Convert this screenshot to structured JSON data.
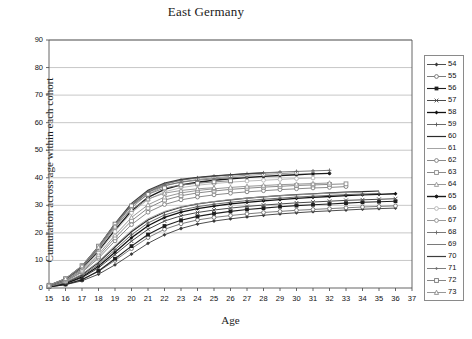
{
  "chart_data": {
    "type": "line",
    "title": "East Germany",
    "xlabel": "Age",
    "ylabel": "Cumulation across age within each cohort",
    "xlim": [
      15,
      37
    ],
    "ylim": [
      0,
      90
    ],
    "yticks": [
      0,
      10,
      20,
      30,
      40,
      50,
      60,
      70,
      80,
      90
    ],
    "xticks": [
      15,
      16,
      17,
      18,
      19,
      20,
      21,
      22,
      23,
      24,
      25,
      26,
      27,
      28,
      29,
      30,
      31,
      32,
      33,
      34,
      35,
      36,
      37
    ],
    "grid": "horizontal",
    "legend_position": "right",
    "legend_title": "",
    "series": [
      {
        "name": "54",
        "marker": "diamond-filled",
        "color": "#3a3a3a",
        "width": 0.9,
        "x": [
          15,
          16,
          17,
          18,
          19,
          20,
          21,
          22,
          23,
          24,
          25,
          26,
          27,
          28,
          29,
          30,
          31,
          32,
          33,
          34,
          35,
          36
        ],
        "values": [
          0.4,
          1.2,
          2.6,
          5.0,
          8.4,
          12.3,
          16.2,
          19.3,
          21.6,
          23.2,
          24.3,
          25.1,
          25.8,
          26.4,
          26.9,
          27.3,
          27.7,
          28.0,
          28.3,
          28.6,
          28.8,
          29.0
        ]
      },
      {
        "name": "55",
        "marker": "circle-open",
        "color": "#6e6e6e",
        "width": 0.9,
        "x": [
          15,
          16,
          17,
          18,
          19,
          20,
          21,
          22,
          23,
          24,
          25,
          26,
          27,
          28,
          29,
          30,
          31,
          32,
          33,
          34,
          35,
          36
        ],
        "values": [
          0.5,
          1.4,
          3.1,
          6.0,
          10.0,
          14.3,
          18.3,
          21.3,
          23.3,
          24.7,
          25.6,
          26.3,
          26.9,
          27.4,
          27.8,
          28.2,
          28.5,
          28.8,
          29.1,
          29.4,
          29.6,
          29.8
        ]
      },
      {
        "name": "56",
        "marker": "square-filled",
        "color": "#1f1f1f",
        "width": 1.1,
        "x": [
          15,
          16,
          17,
          18,
          19,
          20,
          21,
          22,
          23,
          24,
          25,
          26,
          27,
          28,
          29,
          30,
          31,
          32,
          33,
          34,
          35,
          36
        ],
        "values": [
          0.4,
          1.3,
          3.0,
          6.2,
          10.6,
          15.2,
          19.4,
          22.5,
          24.6,
          26.0,
          27.0,
          27.8,
          28.5,
          29.0,
          29.5,
          29.9,
          30.2,
          30.5,
          30.8,
          31.1,
          31.3,
          31.5
        ]
      },
      {
        "name": "57",
        "marker": "cross",
        "color": "#4a4a4a",
        "width": 1.0,
        "x": [
          15,
          16,
          17,
          18,
          19,
          20,
          21,
          22,
          23,
          24,
          25,
          26,
          27,
          28,
          29,
          30,
          31,
          32,
          33,
          34,
          35,
          36
        ],
        "values": [
          0.5,
          1.6,
          3.7,
          7.3,
          12.1,
          17.0,
          21.3,
          24.3,
          26.2,
          27.4,
          28.3,
          29.0,
          29.6,
          30.1,
          30.5,
          30.9,
          31.2,
          31.5,
          31.8,
          32.0,
          32.2,
          32.4
        ]
      },
      {
        "name": "58",
        "marker": "diamond-filled",
        "color": "#111111",
        "width": 1.3,
        "x": [
          15,
          16,
          17,
          18,
          19,
          20,
          21,
          22,
          23,
          24,
          25,
          26,
          27,
          28,
          29,
          30,
          31,
          32,
          33,
          34,
          35,
          36
        ],
        "values": [
          0.5,
          1.7,
          4.0,
          7.9,
          13.0,
          18.2,
          22.6,
          25.6,
          27.5,
          28.8,
          29.7,
          30.5,
          31.1,
          31.6,
          32.1,
          32.5,
          32.9,
          33.2,
          33.5,
          33.8,
          34.0,
          34.2
        ]
      },
      {
        "name": "59",
        "marker": "plus",
        "color": "#5a5a5a",
        "width": 0.9,
        "x": [
          15,
          16,
          17,
          18,
          19,
          20,
          21,
          22,
          23,
          24,
          25,
          26,
          27,
          28,
          29,
          30,
          31,
          32,
          33,
          34,
          35
        ],
        "values": [
          0.6,
          1.9,
          4.4,
          8.5,
          13.9,
          19.3,
          23.6,
          26.5,
          28.3,
          29.5,
          30.4,
          31.1,
          31.7,
          32.2,
          32.6,
          33.0,
          33.3,
          33.6,
          33.9,
          34.1,
          34.3
        ]
      },
      {
        "name": "60",
        "marker": "line",
        "color": "#2b2b2b",
        "width": 1.2,
        "x": [
          15,
          16,
          17,
          18,
          19,
          20,
          21,
          22,
          23,
          24,
          25,
          26,
          27,
          28,
          29,
          30,
          31,
          32,
          33,
          34,
          35
        ],
        "values": [
          0.6,
          2.0,
          4.8,
          9.2,
          14.9,
          20.4,
          24.7,
          27.5,
          29.3,
          30.5,
          31.3,
          32.0,
          32.6,
          33.1,
          33.5,
          33.9,
          34.2,
          34.5,
          34.8,
          35.0,
          35.2
        ]
      },
      {
        "name": "61",
        "marker": "line",
        "color": "#9a9a9a",
        "width": 0.9,
        "x": [
          15,
          16,
          17,
          18,
          19,
          20,
          21,
          22,
          23,
          24,
          25,
          26,
          27,
          28,
          29,
          30,
          31,
          32,
          33,
          34
        ],
        "values": [
          0.6,
          2.1,
          5.0,
          9.6,
          15.4,
          20.9,
          25.1,
          27.8,
          29.5,
          30.6,
          31.4,
          32.1,
          32.6,
          33.1,
          33.5,
          33.8,
          34.1,
          34.4,
          34.6,
          34.8
        ]
      },
      {
        "name": "62",
        "marker": "circle-open",
        "color": "#7d7d7d",
        "width": 0.9,
        "x": [
          15,
          16,
          17,
          18,
          19,
          20,
          21,
          22,
          23,
          24,
          25,
          26,
          27,
          28,
          29,
          30,
          31,
          32,
          33
        ],
        "values": [
          0.7,
          2.4,
          5.7,
          10.8,
          17.1,
          23.0,
          27.5,
          30.3,
          32.0,
          33.0,
          33.8,
          34.4,
          34.9,
          35.3,
          35.7,
          36.0,
          36.3,
          36.5,
          36.8
        ]
      },
      {
        "name": "63",
        "marker": "square-open",
        "color": "#8a8a8a",
        "width": 1.0,
        "x": [
          15,
          16,
          17,
          18,
          19,
          20,
          21,
          22,
          23,
          24,
          25,
          26,
          27,
          28,
          29,
          30,
          31,
          32,
          33
        ],
        "values": [
          0.7,
          2.5,
          6.0,
          11.5,
          18.2,
          24.4,
          29.0,
          31.9,
          33.5,
          34.5,
          35.2,
          35.8,
          36.2,
          36.6,
          36.9,
          37.2,
          37.4,
          37.6,
          37.8
        ]
      },
      {
        "name": "64",
        "marker": "triangle-open",
        "color": "#989898",
        "width": 1.0,
        "x": [
          15,
          16,
          17,
          18,
          19,
          20,
          21,
          22,
          23,
          24,
          25,
          26,
          27,
          28,
          29,
          30,
          31,
          32
        ],
        "values": [
          0.8,
          2.7,
          6.4,
          12.2,
          19.2,
          25.6,
          30.2,
          33.0,
          34.5,
          35.4,
          36.0,
          36.5,
          36.9,
          37.2,
          37.5,
          37.7,
          37.9,
          38.1
        ]
      },
      {
        "name": "65",
        "marker": "asterisk",
        "color": "#1a1a1a",
        "width": 1.4,
        "x": [
          15,
          16,
          17,
          18,
          19,
          20,
          21,
          22,
          23,
          24,
          25,
          26,
          27,
          28,
          29,
          30,
          31,
          32
        ],
        "values": [
          0.8,
          2.9,
          7.0,
          13.4,
          21.1,
          28.0,
          32.9,
          35.8,
          37.4,
          38.4,
          39.1,
          39.6,
          40.1,
          40.5,
          40.8,
          41.1,
          41.4,
          41.6
        ]
      },
      {
        "name": "66",
        "marker": "circle-open",
        "color": "#b3b3b3",
        "width": 0.9,
        "x": [
          15,
          16,
          17,
          18,
          19,
          20,
          21,
          22,
          23,
          24,
          25,
          26,
          27,
          28,
          29,
          30,
          31
        ],
        "values": [
          0.8,
          2.8,
          6.8,
          13.0,
          20.5,
          27.3,
          32.1,
          34.9,
          36.4,
          37.3,
          37.9,
          38.4,
          38.8,
          39.1,
          39.4,
          39.7,
          39.9
        ]
      },
      {
        "name": "67",
        "marker": "circle-open",
        "color": "#8f8f8f",
        "width": 0.9,
        "x": [
          15,
          16,
          17,
          18,
          19,
          20,
          21,
          22,
          23,
          24,
          25,
          26,
          27,
          28,
          29,
          30
        ],
        "values": [
          0.9,
          3.0,
          7.3,
          13.9,
          21.9,
          29.1,
          34.1,
          37.0,
          38.5,
          39.4,
          40.0,
          40.5,
          40.9,
          41.2,
          41.5,
          41.8
        ]
      },
      {
        "name": "68",
        "marker": "plus",
        "color": "#6a6a6a",
        "width": 0.9,
        "x": [
          15,
          16,
          17,
          18,
          19,
          20,
          21,
          22,
          23,
          24,
          25,
          26,
          27,
          28,
          29,
          30,
          31,
          32
        ],
        "values": [
          0.9,
          3.1,
          7.5,
          14.3,
          22.5,
          29.8,
          34.8,
          37.6,
          39.1,
          40.0,
          40.6,
          41.1,
          41.5,
          41.8,
          42.1,
          42.3,
          42.5,
          42.7
        ]
      },
      {
        "name": "69",
        "marker": "line",
        "color": "#7a7a7a",
        "width": 1.0,
        "x": [
          15,
          16,
          17,
          18,
          19,
          20,
          21,
          22,
          23,
          24,
          25,
          26,
          27,
          28,
          29
        ],
        "values": [
          0.9,
          3.2,
          7.7,
          14.6,
          22.9,
          30.2,
          35.1,
          37.8,
          39.2,
          40.0,
          40.6,
          41.0,
          41.4,
          41.7,
          42.0
        ]
      },
      {
        "name": "70",
        "marker": "line",
        "color": "#3d3d3d",
        "width": 1.2,
        "x": [
          15,
          16,
          17,
          18,
          19,
          20,
          21,
          22,
          23,
          24,
          25,
          26,
          27,
          28
        ],
        "values": [
          1.0,
          3.3,
          7.9,
          15.0,
          23.4,
          30.7,
          35.5,
          38.1,
          39.4,
          40.2,
          40.7,
          41.1,
          41.5,
          41.8
        ]
      },
      {
        "name": "71",
        "marker": "diamond-small",
        "color": "#6f6f6f",
        "width": 0.9,
        "x": [
          15,
          16,
          17,
          18,
          19,
          20,
          21,
          22,
          23,
          24,
          25,
          26,
          27
        ],
        "values": [
          1.0,
          3.3,
          8.0,
          15.1,
          23.3,
          30.2,
          34.7,
          37.2,
          38.4,
          39.1,
          39.6,
          40.0,
          40.3
        ]
      },
      {
        "name": "72",
        "marker": "square-open",
        "color": "#787878",
        "width": 0.9,
        "x": [
          15,
          16,
          17,
          18,
          19,
          20,
          21,
          22,
          23,
          24,
          25,
          26
        ],
        "values": [
          1.0,
          3.4,
          8.1,
          15.2,
          23.2,
          29.8,
          34.0,
          36.3,
          37.4,
          38.0,
          38.5,
          38.9
        ]
      },
      {
        "name": "73",
        "marker": "triangle-open",
        "color": "#8c8c8c",
        "width": 0.9,
        "x": [
          15,
          16,
          17,
          18,
          19,
          20,
          21,
          22,
          23,
          24,
          25
        ],
        "values": [
          1.0,
          3.4,
          8.0,
          14.8,
          22.4,
          28.5,
          32.3,
          34.4,
          35.4,
          36.0,
          36.4
        ]
      }
    ]
  },
  "legend": {
    "items": [
      "54",
      "55",
      "56",
      "57",
      "58",
      "59",
      "60",
      "61",
      "62",
      "63",
      "64",
      "65",
      "66",
      "67",
      "68",
      "69",
      "70",
      "71",
      "72",
      "73"
    ]
  }
}
